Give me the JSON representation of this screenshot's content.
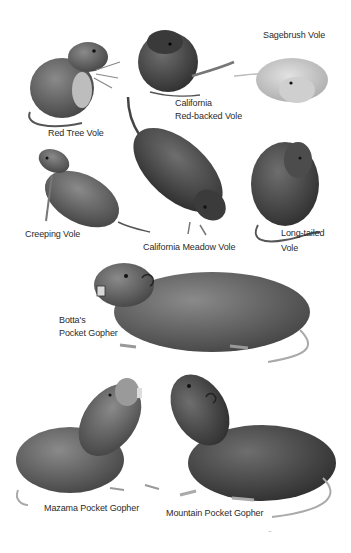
{
  "plate": {
    "background": "#ffffff",
    "fur_colors": {
      "dark": "#3a3a3a",
      "mid": "#5e5e5e",
      "light": "#9a9a9a",
      "pale": "#cfcfcf"
    },
    "animals": [
      {
        "id": "red-tree-vole",
        "label": "Red Tree Vole"
      },
      {
        "id": "california-red-backed-vole",
        "label_line1": "California",
        "label_line2": "Red-backed Vole"
      },
      {
        "id": "sagebrush-vole",
        "label": "Sagebrush Vole"
      },
      {
        "id": "creeping-vole",
        "label": "Creeping Vole"
      },
      {
        "id": "california-meadow-vole",
        "label": "California Meadow Vole"
      },
      {
        "id": "long-tailed-vole",
        "label_line1": "Long-tailed",
        "label_line2": "Vole"
      },
      {
        "id": "bottas-pocket-gopher",
        "label_line1": "Botta's",
        "label_line2": "Pocket Gopher"
      },
      {
        "id": "mazama-pocket-gopher",
        "label": "Mazama Pocket Gopher"
      },
      {
        "id": "mountain-pocket-gopher",
        "label": "Mountain Pocket Gopher"
      }
    ],
    "signature": "signature"
  }
}
